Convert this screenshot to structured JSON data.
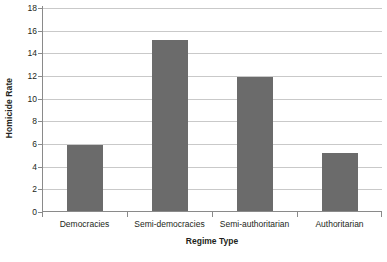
{
  "chart_data": {
    "type": "bar",
    "title": "",
    "subtitle": "",
    "xlabel": "Regime Type",
    "ylabel": "Homicide Rate",
    "categories": [
      "Democracies",
      "Semi-democracies",
      "Semi-authoritarian",
      "Authoritarian"
    ],
    "values": [
      5.8,
      15.1,
      11.8,
      5.1
    ],
    "ylim": [
      0,
      18
    ],
    "ytick_labels": [
      "0",
      "2",
      "4",
      "6",
      "8",
      "10",
      "12",
      "14",
      "16",
      "18"
    ],
    "ytick_values": [
      0,
      2,
      4,
      6,
      8,
      10,
      12,
      14,
      16,
      18
    ],
    "grid": "horizontal",
    "legend": "none",
    "bar_color": "#6b6b6b",
    "gridline_color": "#c9c9c9",
    "axis_color": "#8a8a8a",
    "text_color": "#231f20",
    "background_color": "#ffffff"
  }
}
